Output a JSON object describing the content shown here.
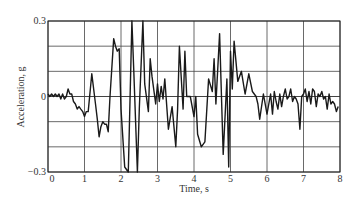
{
  "chart_data": {
    "type": "line",
    "title": "",
    "xlabel": "Time, s",
    "ylabel": "Acceleration, g",
    "xlim": [
      0,
      8
    ],
    "ylim": [
      -0.3,
      0.3
    ],
    "grid": true,
    "legend": null,
    "x_ticks": [
      0,
      1,
      2,
      3,
      4,
      5,
      6,
      7,
      8
    ],
    "x_tick_labels": [
      "0",
      "1",
      "2",
      "3",
      "4",
      "5",
      "6",
      "7",
      "8"
    ],
    "y_ticks": [
      0.3,
      0,
      -0.3
    ],
    "y_tick_labels": [
      "0.3",
      "0",
      "−0.3"
    ],
    "y_gridlines": [
      0.3,
      0.2,
      0.1,
      0,
      -0.1,
      -0.2,
      -0.3
    ],
    "series": [
      {
        "name": "Ground acceleration record",
        "color": "#1a1a1a",
        "x": [
          0.0,
          0.05,
          0.1,
          0.15,
          0.2,
          0.25,
          0.3,
          0.35,
          0.4,
          0.45,
          0.5,
          0.55,
          0.6,
          0.65,
          0.7,
          0.75,
          0.8,
          0.85,
          0.9,
          0.95,
          1.0,
          1.05,
          1.1,
          1.2,
          1.3,
          1.35,
          1.4,
          1.45,
          1.5,
          1.55,
          1.6,
          1.65,
          1.7,
          1.8,
          1.85,
          1.9,
          1.95,
          2.0,
          2.1,
          2.2,
          2.3,
          2.35,
          2.45,
          2.5,
          2.6,
          2.65,
          2.75,
          2.8,
          2.85,
          2.95,
          3.0,
          3.05,
          3.1,
          3.15,
          3.2,
          3.3,
          3.4,
          3.5,
          3.55,
          3.6,
          3.7,
          3.75,
          3.8,
          3.9,
          4.0,
          4.05,
          4.1,
          4.2,
          4.3,
          4.4,
          4.5,
          4.55,
          4.6,
          4.7,
          4.8,
          4.9,
          4.95,
          5.0,
          5.05,
          5.1,
          5.2,
          5.3,
          5.4,
          5.5,
          5.6,
          5.7,
          5.75,
          5.8,
          5.9,
          6.0,
          6.05,
          6.1,
          6.15,
          6.2,
          6.25,
          6.3,
          6.35,
          6.4,
          6.45,
          6.5,
          6.55,
          6.6,
          6.65,
          6.7,
          6.75,
          6.8,
          6.85,
          6.9,
          6.95,
          7.0,
          7.05,
          7.1,
          7.15,
          7.2,
          7.25,
          7.3,
          7.35,
          7.4,
          7.45,
          7.5,
          7.55,
          7.6,
          7.65,
          7.7,
          7.75,
          7.8,
          7.85,
          7.9,
          7.95
        ],
        "y": [
          0.01,
          0.0,
          0.01,
          0.0,
          0.01,
          0.0,
          0.01,
          -0.01,
          0.01,
          -0.01,
          0.0,
          0.03,
          0.01,
          0.01,
          -0.02,
          -0.03,
          -0.05,
          -0.04,
          -0.05,
          -0.06,
          -0.08,
          -0.06,
          -0.06,
          0.09,
          -0.03,
          -0.09,
          -0.16,
          -0.12,
          -0.1,
          -0.11,
          -0.11,
          -0.14,
          0.0,
          0.23,
          0.2,
          0.18,
          0.19,
          -0.05,
          -0.28,
          -0.3,
          0.3,
          0.1,
          -0.3,
          -0.05,
          0.3,
          0.05,
          -0.06,
          0.15,
          0.08,
          -0.03,
          0.05,
          -0.02,
          0.04,
          -0.01,
          0.07,
          -0.13,
          -0.04,
          -0.2,
          -0.05,
          0.2,
          -0.05,
          0.18,
          0.0,
          0.0,
          -0.08,
          0.0,
          -0.15,
          -0.2,
          -0.18,
          0.07,
          0.02,
          0.15,
          -0.03,
          0.25,
          -0.23,
          0.07,
          -0.28,
          0.18,
          0.03,
          0.22,
          0.06,
          0.1,
          0.01,
          0.09,
          0.02,
          0.0,
          -0.03,
          -0.09,
          0.01,
          -0.07,
          -0.03,
          0.01,
          -0.07,
          0.02,
          -0.02,
          -0.05,
          0.01,
          -0.04,
          0.0,
          0.03,
          -0.01,
          0.0,
          0.03,
          -0.02,
          0.0,
          -0.01,
          -0.03,
          -0.13,
          0.0,
          0.01,
          0.03,
          -0.02,
          0.02,
          -0.03,
          0.03,
          0.02,
          -0.04,
          0.01,
          0.0,
          0.02,
          -0.01,
          0.0,
          -0.05,
          0.01,
          -0.03,
          -0.02,
          -0.03,
          -0.06,
          -0.04
        ]
      }
    ]
  }
}
